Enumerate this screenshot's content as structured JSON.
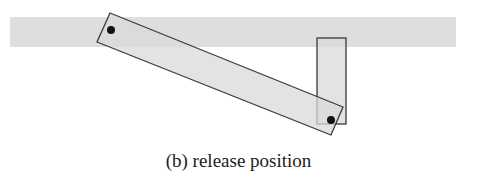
{
  "caption": "(b) release position",
  "colors": {
    "band": "#dedede",
    "link_fill": "#d9d9d9",
    "outline": "#3a3a3a",
    "joint": "#111111"
  },
  "band": {
    "x": 10,
    "y": 17,
    "width": 446,
    "height": 30
  },
  "long_link": {
    "points": "110,13 343,107 331,135 97,42"
  },
  "short_link": {
    "x": 317,
    "y": 38,
    "width": 29,
    "height": 86
  },
  "joints": [
    {
      "cx": 111,
      "cy": 30,
      "r": 4
    },
    {
      "cx": 331,
      "cy": 120,
      "r": 4
    }
  ]
}
